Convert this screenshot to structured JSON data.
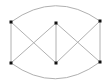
{
  "diagram": {
    "type": "graph",
    "directed": false,
    "colors": {
      "edge": "#b0b0b0",
      "node": "#111111",
      "background": "#ffffff"
    },
    "nodes": [
      {
        "id": "LT",
        "x": 11,
        "y": 22
      },
      {
        "id": "LB",
        "x": 11,
        "y": 63
      },
      {
        "id": "CT",
        "x": 56,
        "y": 23
      },
      {
        "id": "CB",
        "x": 56,
        "y": 63
      },
      {
        "id": "RT",
        "x": 100,
        "y": 21
      },
      {
        "id": "RB",
        "x": 100,
        "y": 62
      }
    ],
    "edges": [
      {
        "from": "LT",
        "to": "LB",
        "shape": "line"
      },
      {
        "from": "LT",
        "to": "CB",
        "shape": "line"
      },
      {
        "from": "LB",
        "to": "CT",
        "shape": "line"
      },
      {
        "from": "CT",
        "to": "CB",
        "shape": "line"
      },
      {
        "from": "CT",
        "to": "RB",
        "shape": "line"
      },
      {
        "from": "CB",
        "to": "RT",
        "shape": "line"
      },
      {
        "from": "RT",
        "to": "RB",
        "shape": "line"
      },
      {
        "from": "LT",
        "to": "RT",
        "shape": "arc",
        "ctrl_y": -10
      },
      {
        "from": "LB",
        "to": "RB",
        "shape": "arc",
        "ctrl_y": 95
      }
    ]
  }
}
